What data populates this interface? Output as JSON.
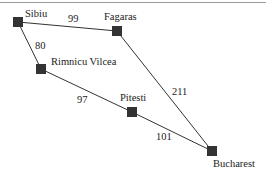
{
  "diagram": {
    "type": "weighted-graph",
    "colors": {
      "node": "#333333",
      "edge": "#333333",
      "text": "#222222",
      "top_rule": "#9a9a9a"
    },
    "nodes": [
      {
        "id": "sibiu",
        "label": "Sibiu",
        "x": 18,
        "y": 22,
        "label_x": 25,
        "label_y": 17
      },
      {
        "id": "fagaras",
        "label": "Fagaras",
        "x": 117,
        "y": 31,
        "label_x": 104,
        "label_y": 20
      },
      {
        "id": "rimnicu_vilcea",
        "label": "Rimnicu Vilcea",
        "x": 41,
        "y": 69,
        "label_x": 51,
        "label_y": 65
      },
      {
        "id": "pitesti",
        "label": "Pitesti",
        "x": 132,
        "y": 112,
        "label_x": 120,
        "label_y": 101
      },
      {
        "id": "bucharest",
        "label": "Bucharest",
        "x": 212,
        "y": 151,
        "label_x": 213,
        "label_y": 167
      }
    ],
    "edges": [
      {
        "from": "sibiu",
        "to": "fagaras",
        "weight": "99",
        "label_x": 68,
        "label_y": 22
      },
      {
        "from": "sibiu",
        "to": "rimnicu_vilcea",
        "weight": "80",
        "label_x": 35,
        "label_y": 49
      },
      {
        "from": "rimnicu_vilcea",
        "to": "pitesti",
        "weight": "97",
        "label_x": 77,
        "label_y": 103
      },
      {
        "from": "fagaras",
        "to": "bucharest",
        "weight": "211",
        "label_x": 172,
        "label_y": 95
      },
      {
        "from": "pitesti",
        "to": "bucharest",
        "weight": "101",
        "label_x": 156,
        "label_y": 140
      }
    ]
  }
}
